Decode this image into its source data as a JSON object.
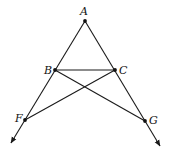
{
  "diagram": {
    "type": "geometry",
    "stroke_color": "#1a1a1a",
    "background": "#ffffff",
    "points": {
      "A": {
        "label": "A",
        "x": 85,
        "y": 21,
        "label_x": 80,
        "label_y": 15
      },
      "B": {
        "label": "B",
        "x": 55,
        "y": 70,
        "label_x": 44,
        "label_y": 74
      },
      "C": {
        "label": "C",
        "x": 115,
        "y": 70,
        "label_x": 119,
        "label_y": 74
      },
      "F": {
        "label": "F",
        "x": 25,
        "y": 120,
        "label_x": 15,
        "label_y": 122
      },
      "G": {
        "label": "G",
        "x": 145,
        "y": 121,
        "label_x": 149,
        "label_y": 124
      }
    },
    "segments": [
      {
        "from": "B",
        "to": "C"
      },
      {
        "from": "B",
        "to": "G"
      },
      {
        "from": "C",
        "to": "F"
      }
    ],
    "rays": [
      {
        "from": "A",
        "through": [
          "B",
          "F"
        ],
        "arrow_end": {
          "x": 11,
          "y": 143
        }
      },
      {
        "from": "A",
        "through": [
          "C",
          "G"
        ],
        "arrow_end": {
          "x": 160,
          "y": 146
        }
      }
    ]
  }
}
